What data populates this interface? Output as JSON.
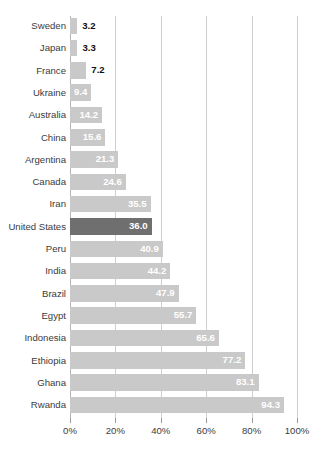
{
  "chart_data": {
    "type": "bar",
    "orientation": "horizontal",
    "title": "",
    "xlabel": "",
    "ylabel": "",
    "xlim": [
      0,
      100
    ],
    "xticks": [
      0,
      20,
      40,
      60,
      80,
      100
    ],
    "xticklabels": [
      "0%",
      "20%",
      "40%",
      "60%",
      "80%",
      "100%"
    ],
    "grid": true,
    "legend": null,
    "categories": [
      "Sweden",
      "Japan",
      "France",
      "Ukraine",
      "Australia",
      "China",
      "Argentina",
      "Canada",
      "Iran",
      "United States",
      "Peru",
      "India",
      "Brazil",
      "Egypt",
      "Indonesia",
      "Ethiopia",
      "Ghana",
      "Rwanda"
    ],
    "values": [
      3.2,
      3.3,
      7.2,
      9.4,
      14.2,
      15.6,
      21.3,
      24.6,
      35.5,
      36.0,
      40.9,
      44.2,
      47.9,
      55.7,
      65.6,
      77.2,
      83.1,
      94.3
    ],
    "value_labels": [
      "3.2",
      "3.3",
      "7.2",
      "9.4",
      "14.2",
      "15.6",
      "21.3",
      "24.6",
      "35.5",
      "36.0",
      "40.9",
      "44.2",
      "47.9",
      "55.7",
      "65.6",
      "77.2",
      "83.1",
      "94.3"
    ],
    "label_placement": [
      "outside",
      "outside",
      "outside",
      "inside",
      "inside",
      "inside",
      "inside",
      "inside",
      "inside",
      "inside",
      "inside",
      "inside",
      "inside",
      "inside",
      "inside",
      "inside",
      "inside",
      "inside"
    ],
    "highlighted_category": "United States",
    "colors": {
      "bar": "#c9c9c9",
      "bar_highlight": "#6f6f6f",
      "gridline": "#cfcfcf",
      "axis": "#b5b5b5",
      "label_text": "#3b3b3b",
      "value_text_inside": "#ffffff",
      "value_text_outside": "#111111",
      "background": "#ffffff"
    }
  }
}
